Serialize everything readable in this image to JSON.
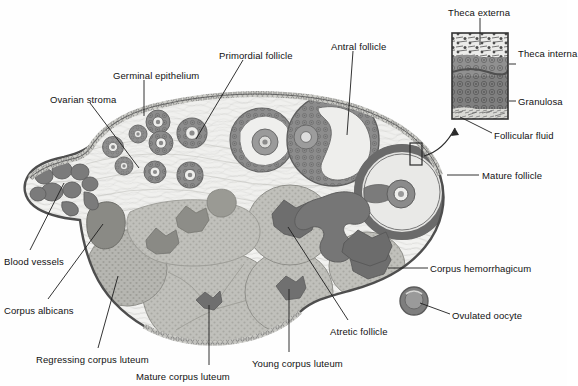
{
  "figure": {
    "type": "anatomical-diagram",
    "background_color": "#ffffff",
    "ink_color": "#111111"
  },
  "palette": {
    "outline": "#4a4a4a",
    "stroma_light": "#f0f0ee",
    "stroma_mid": "#d8d8d4",
    "granulosa_dark": "#8e8e8e",
    "theca_dark": "#6e6e6e",
    "antrum_light": "#e8e8e6",
    "luteum_fill": "#b9b9b4",
    "vessel_dark": "#6b6b6b",
    "inset_band_externa": "#e9e9e7",
    "inset_band_interna": "#8c8c8c",
    "inset_band_granulosa": "#7a7a7a",
    "inset_band_fluid": "#d6d6d2"
  },
  "labels": [
    {
      "id": "ovarian-stroma",
      "text": "Ovarian stroma",
      "x": 50,
      "y": 94,
      "anchor": "start"
    },
    {
      "id": "germinal-epithelium",
      "text": "Germinal epithelium",
      "x": 113,
      "y": 70,
      "anchor": "start"
    },
    {
      "id": "primordial-follicle",
      "text": "Primordial follicle",
      "x": 219,
      "y": 50,
      "anchor": "start"
    },
    {
      "id": "antral-follicle",
      "text": "Antral follicle",
      "x": 331,
      "y": 41,
      "anchor": "start"
    },
    {
      "id": "theca-externa",
      "text": "Theca externa",
      "x": 448,
      "y": 7,
      "anchor": "start"
    },
    {
      "id": "theca-interna",
      "text": "Theca\ninterna",
      "x": 518,
      "y": 48,
      "anchor": "start"
    },
    {
      "id": "granulosa",
      "text": "Granulosa",
      "x": 518,
      "y": 96,
      "anchor": "start"
    },
    {
      "id": "follicular-fluid",
      "text": "Follicular fluid",
      "x": 494,
      "y": 130,
      "anchor": "start"
    },
    {
      "id": "mature-follicle",
      "text": "Mature follicle",
      "x": 482,
      "y": 170,
      "anchor": "start"
    },
    {
      "id": "corpus-hemorrhagicum",
      "text": "Corpus hemorrhagicum",
      "x": 430,
      "y": 263,
      "anchor": "start"
    },
    {
      "id": "ovulated-oocyte",
      "text": "Ovulated oocyte",
      "x": 452,
      "y": 310,
      "anchor": "start"
    },
    {
      "id": "blood-vessels",
      "text": "Blood vessels",
      "x": 4,
      "y": 256,
      "anchor": "start"
    },
    {
      "id": "corpus-albicans",
      "text": "Corpus albicans",
      "x": 4,
      "y": 305,
      "anchor": "start"
    },
    {
      "id": "regressing-corpus-luteum",
      "text": "Regressing corpus luteum",
      "x": 36,
      "y": 354,
      "anchor": "start"
    },
    {
      "id": "mature-corpus-luteum",
      "text": "Mature corpus luteum",
      "x": 136,
      "y": 371,
      "anchor": "start"
    },
    {
      "id": "young-corpus-luteum",
      "text": "Young corpus luteum",
      "x": 252,
      "y": 358,
      "anchor": "start"
    },
    {
      "id": "atretic-follicle",
      "text": "Atretic follicle",
      "x": 330,
      "y": 326,
      "anchor": "start"
    }
  ],
  "inset": {
    "name": "follicle-wall-inset",
    "x": 452,
    "y": 33,
    "width": 56,
    "height": 86,
    "bands": [
      {
        "name": "theca-externa-band",
        "label": "Theca externa",
        "height_fraction": 0.27
      },
      {
        "name": "theca-interna-band",
        "label": "Theca interna",
        "height_fraction": 0.22
      },
      {
        "name": "granulosa-band",
        "label": "Granulosa",
        "height_fraction": 0.39
      },
      {
        "name": "follicular-fluid-band",
        "label": "Follicular fluid",
        "height_fraction": 0.12
      }
    ],
    "source_box": {
      "x": 410,
      "y": 143,
      "width": 12,
      "height": 22
    }
  },
  "structures": [
    {
      "name": "ovary-outline",
      "kind": "boundary"
    },
    {
      "name": "germinal-epithelium-edge",
      "kind": "boundary"
    },
    {
      "name": "primordial-follicles",
      "count": 9
    },
    {
      "name": "antral-follicle",
      "count": 1
    },
    {
      "name": "mature-follicle",
      "count": 1
    },
    {
      "name": "atretic-follicles",
      "count": 3
    },
    {
      "name": "corpus-hemorrhagicum",
      "count": 1
    },
    {
      "name": "young-corpus-luteum",
      "count": 1
    },
    {
      "name": "mature-corpus-luteum",
      "count": 1
    },
    {
      "name": "regressing-corpus-luteum",
      "count": 1
    },
    {
      "name": "corpus-albicans",
      "count": 1
    },
    {
      "name": "blood-vessels",
      "count": 1
    },
    {
      "name": "ovulated-oocyte",
      "count": 1
    }
  ]
}
